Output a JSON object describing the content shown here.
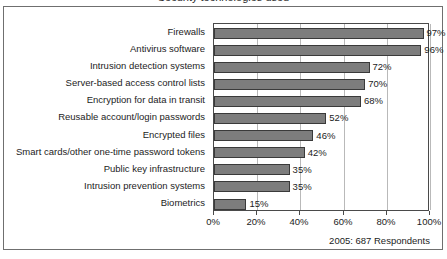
{
  "figure": {
    "clipped_title": "Security technologies used",
    "footnote": "2005: 687 Respondents"
  },
  "chart_data": {
    "type": "bar",
    "orientation": "horizontal",
    "title": "",
    "xlabel": "",
    "ylabel": "",
    "xlim": [
      0,
      100
    ],
    "grid": true,
    "legend": false,
    "value_suffix": "%",
    "categories": [
      "Firewalls",
      "Antivirus software",
      "Intrusion detection systems",
      "Server-based access control lists",
      "Encryption for data in transit",
      "Reusable account/login passwords",
      "Encrypted files",
      "Smart cards/other one-time password tokens",
      "Public key infrastructure",
      "Intrusion prevention systems",
      "Biometrics"
    ],
    "values": [
      97,
      96,
      72,
      70,
      68,
      52,
      46,
      42,
      35,
      35,
      15
    ],
    "value_labels": [
      "97%",
      "96%",
      "72%",
      "70%",
      "68%",
      "52%",
      "46%",
      "42%",
      "35%",
      "35%",
      "15%"
    ],
    "xticks": [
      0,
      20,
      40,
      60,
      80,
      100
    ],
    "xtick_labels": [
      "0%",
      "20%",
      "40%",
      "60%",
      "80%",
      "100%"
    ],
    "colors": {
      "bar_fill": "#7d7d7d",
      "bar_edge": "#3a3a3a",
      "gridline": "#b9b9b9",
      "axis": "#4a4a4a",
      "frame": "#6f6f6f",
      "text": "#1c1c1c",
      "background": "#ffffff"
    }
  }
}
